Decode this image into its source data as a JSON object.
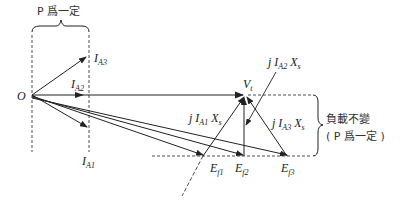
{
  "diagram": {
    "title_top": "P 爲一定",
    "origin_label": "O",
    "current_labels": {
      "IA3": {
        "main": "I",
        "sub": "A3"
      },
      "IA2": {
        "main": "I",
        "sub": "A2"
      },
      "IA1": {
        "main": "I",
        "sub": "A1"
      }
    },
    "vt_label": {
      "main": "V",
      "sub": "t"
    },
    "drop_labels": {
      "jIA2Xs": {
        "pre": "j I",
        "sub": "A2",
        "post": "X",
        "post_sub": "s"
      },
      "jIA1Xs": {
        "pre": "j I",
        "sub": "A1",
        "post": "X",
        "post_sub": "s"
      },
      "jIA3Xs": {
        "pre": "j I",
        "sub": "A3",
        "post": "X",
        "post_sub": "s"
      }
    },
    "emf_labels": {
      "Ef1": {
        "main": "E",
        "sub": "f1"
      },
      "Ef2": {
        "main": "E",
        "sub": "f2"
      },
      "Ef3": {
        "main": "E",
        "sub": "f3"
      }
    },
    "right_note_line1": "負載不變",
    "right_note_line2": "( P 爲一定 )",
    "colors": {
      "line": "#222222",
      "text": "#222222"
    }
  }
}
